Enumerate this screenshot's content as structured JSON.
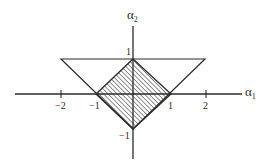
{
  "diagram": {
    "type": "coordinate-region-plot",
    "axes": {
      "x_label": "α",
      "x_label_sub": "1",
      "y_label": "α",
      "y_label_sub": "2"
    },
    "x_ticks": [
      {
        "value": -2,
        "label": "−2"
      },
      {
        "value": -1,
        "label": "−1"
      },
      {
        "value": 1,
        "label": "1"
      },
      {
        "value": 2,
        "label": "2"
      }
    ],
    "y_ticks": [
      {
        "value": 1,
        "label": "1"
      },
      {
        "value": -1,
        "label": "−1"
      }
    ],
    "shapes": {
      "triangle": {
        "description": "Triangle bounded by α2 = 1 and lines through (0,-1)",
        "vertices": [
          [
            -2,
            1
          ],
          [
            2,
            1
          ],
          [
            0,
            -1
          ]
        ]
      },
      "hatched_diamond": {
        "description": "Hatched square |α1| + |α2| ≤ 1",
        "vertices": [
          [
            0,
            1
          ],
          [
            1,
            0
          ],
          [
            0,
            -1
          ],
          [
            -1,
            0
          ]
        ]
      }
    },
    "colors": {
      "line": "#2a2a2a",
      "hatch": "#3a3a3a",
      "background": "#ffffff"
    }
  }
}
